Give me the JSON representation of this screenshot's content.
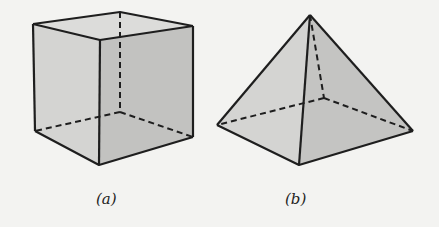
{
  "figure": {
    "panels": [
      {
        "id": "a",
        "caption": "(a)",
        "shape": "cube"
      },
      {
        "id": "b",
        "caption": "(b)",
        "shape": "square pyramid"
      }
    ],
    "colors": {
      "face_light": "#d6d6d4",
      "face_dark": "#bcbcba",
      "stroke": "#1e1e1e",
      "background": "#f3f3f1"
    }
  }
}
